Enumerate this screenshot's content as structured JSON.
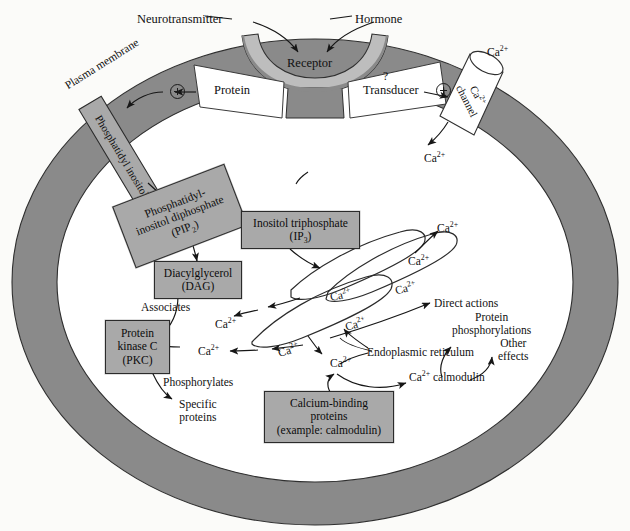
{
  "figure": {
    "colors": {
      "membrane_gray": "#8a8a8a",
      "box_gray": "#a9a9a9",
      "receptor_gray": "#bdbdbd",
      "cutout_white": "#ffffff",
      "stroke": "#2b2b2b",
      "background": "#fbfbf9"
    }
  },
  "external_ligands": {
    "neurotransmitter": "Neurotransmitter",
    "hormone": "Hormone"
  },
  "membrane": {
    "label": "Plasma membrane",
    "receptor": "Receptor",
    "protein": "Protein",
    "transducer": "Transducer",
    "transducer_question": "?",
    "calcium_channel_line1": "Ca",
    "calcium_channel_sup": "2+",
    "calcium_channel_line2": "channel",
    "phosphatidyl_inositol": "Phosphatidyl inositol"
  },
  "boxes": {
    "pip2_line1": "Phosphatidyl-",
    "pip2_line2": "inositol diphosphate",
    "pip2_line3_pre": "(PIP",
    "pip2_line3_sub": "2",
    "pip2_line3_post": ")",
    "ip3_line1": "Inositol triphosphate",
    "ip3_line2_pre": "(IP",
    "ip3_line2_sub": "3",
    "ip3_line2_post": ")",
    "dag_line1": "Diacylglycerol",
    "dag_line2": "(DAG)",
    "pkc_line1": "Protein",
    "pkc_line2": "kinase C",
    "pkc_line3": "(PKC)",
    "cbp_line1": "Calcium-binding",
    "cbp_line2": "proteins",
    "cbp_line3": "(example: calmodulin)"
  },
  "annotations": {
    "associates": "Associates",
    "phosphorylates": "Phosphorylates",
    "specific_line1": "Specific",
    "specific_line2": "proteins",
    "endoplasmic_reticulum": "Endoplasmic reticulum",
    "direct_actions": "Direct actions",
    "protein_phos_line1": "Protein",
    "protein_phos_line2": "phosphorylations",
    "other_line1": "Other",
    "other_line2": "effects",
    "ca_calmodulin_pre": "Ca",
    "ca_calmodulin_sup": "2+",
    "ca_calmodulin_post": " calmodulin"
  },
  "calcium_ions": {
    "label_base": "Ca",
    "label_sup": "2+",
    "positions": [
      {
        "id": "ca-extracellular-top",
        "x": 487,
        "y": 46
      },
      {
        "id": "ca-influx-cytosol",
        "x": 424,
        "y": 152
      },
      {
        "id": "ca-er-release-top",
        "x": 437,
        "y": 222
      },
      {
        "id": "ca-er-lumen-1",
        "x": 408,
        "y": 255
      },
      {
        "id": "ca-er-lumen-2",
        "x": 395,
        "y": 282
      },
      {
        "id": "ca-er-lumen-3",
        "x": 330,
        "y": 289
      },
      {
        "id": "ca-er-lumen-4",
        "x": 345,
        "y": 318
      },
      {
        "id": "ca-er-lumen-5",
        "x": 278,
        "y": 344
      },
      {
        "id": "ca-cytosol-upper",
        "x": 215,
        "y": 318
      },
      {
        "id": "ca-cytosol-lower",
        "x": 198,
        "y": 345
      },
      {
        "id": "ca-near-er-foot",
        "x": 330,
        "y": 357
      }
    ]
  }
}
